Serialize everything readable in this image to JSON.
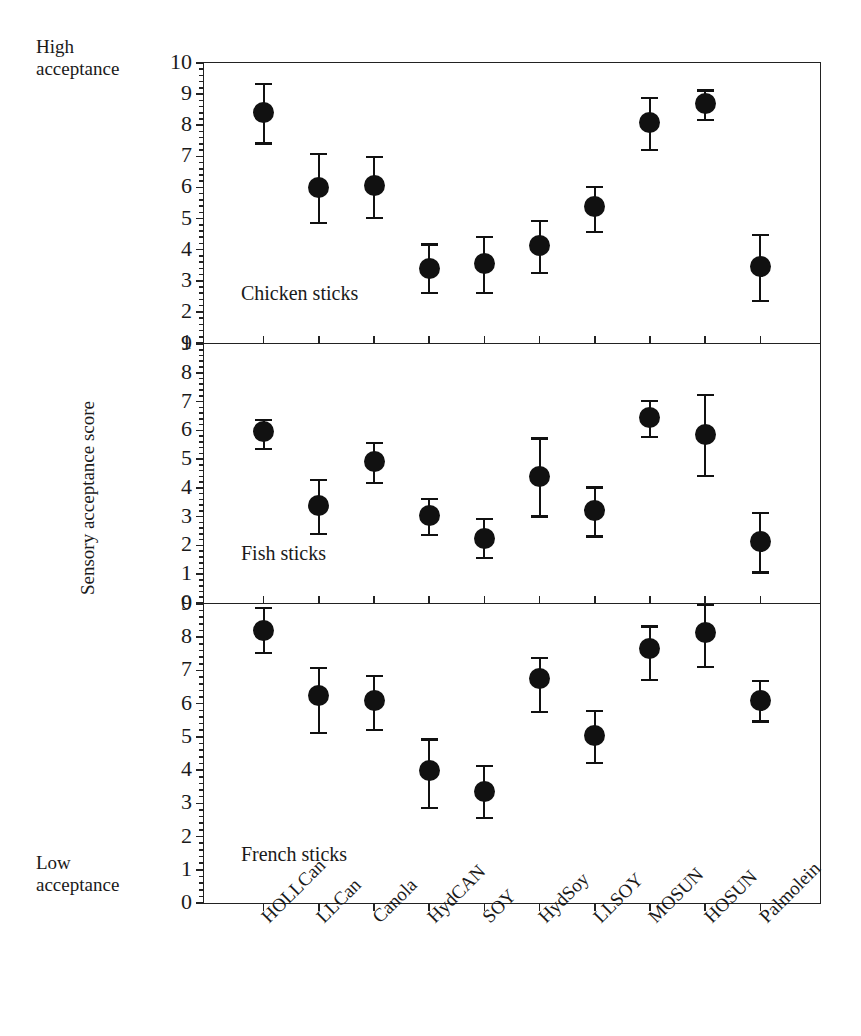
{
  "annotations": {
    "high_acceptance": "High\nacceptance",
    "low_acceptance": "Low\nacceptance",
    "y_axis_title": "Sensory acceptance score"
  },
  "chart_data": {
    "type": "scatter",
    "title": "",
    "xlabel": "",
    "ylabel": "Sensory acceptance score",
    "grid": false,
    "legend": "none",
    "error_bars": "symmetric whisker with caps (mean ± SD)",
    "categories": [
      "HOLLCan",
      "LLCan",
      "Canola",
      "HydCAN",
      "SOY",
      "HydSoy",
      "LLSOY",
      "MOSUN",
      "HOSUN",
      "Palmolein"
    ],
    "panels": [
      {
        "name": "chicken",
        "caption": "Chicken sticks",
        "ylim": [
          1,
          10
        ],
        "yticks": [
          1,
          2,
          3,
          4,
          5,
          6,
          7,
          8,
          9,
          10
        ],
        "values": [
          8.4,
          6.0,
          6.05,
          3.4,
          3.55,
          4.15,
          5.4,
          8.1,
          8.7,
          3.45
        ],
        "err_low": [
          7.45,
          4.9,
          5.05,
          2.65,
          2.65,
          3.3,
          4.6,
          7.25,
          8.2,
          2.4
        ],
        "err_high": [
          9.35,
          7.1,
          7.0,
          4.2,
          4.45,
          4.95,
          6.05,
          8.9,
          9.15,
          4.5
        ]
      },
      {
        "name": "fish",
        "caption": "Fish sticks",
        "ylim": [
          0,
          9
        ],
        "yticks": [
          0,
          1,
          2,
          3,
          4,
          5,
          6,
          7,
          8,
          9
        ],
        "values": [
          5.95,
          3.4,
          4.9,
          3.05,
          2.25,
          4.4,
          3.2,
          6.45,
          5.85,
          2.15
        ],
        "err_low": [
          5.4,
          2.45,
          4.2,
          2.4,
          1.6,
          3.05,
          2.35,
          5.8,
          4.45,
          1.1
        ],
        "err_high": [
          6.4,
          4.3,
          5.6,
          3.65,
          2.95,
          5.75,
          4.05,
          7.05,
          7.25,
          3.15
        ]
      },
      {
        "name": "french",
        "caption": "French sticks",
        "ylim": [
          0,
          9
        ],
        "yticks": [
          0,
          1,
          2,
          3,
          4,
          5,
          6,
          7,
          8,
          9
        ],
        "values": [
          8.2,
          6.25,
          6.1,
          4.0,
          3.35,
          6.75,
          5.05,
          7.65,
          8.15,
          6.1
        ],
        "err_low": [
          7.55,
          5.15,
          5.25,
          2.9,
          2.6,
          5.8,
          4.25,
          6.75,
          7.15,
          5.5
        ],
        "err_high": [
          8.9,
          7.1,
          6.85,
          4.95,
          4.15,
          7.4,
          5.8,
          8.35,
          9.0,
          6.7
        ]
      }
    ]
  },
  "style": {
    "marker_color": "#111111",
    "axis_color": "#222222",
    "background": "#ffffff"
  }
}
